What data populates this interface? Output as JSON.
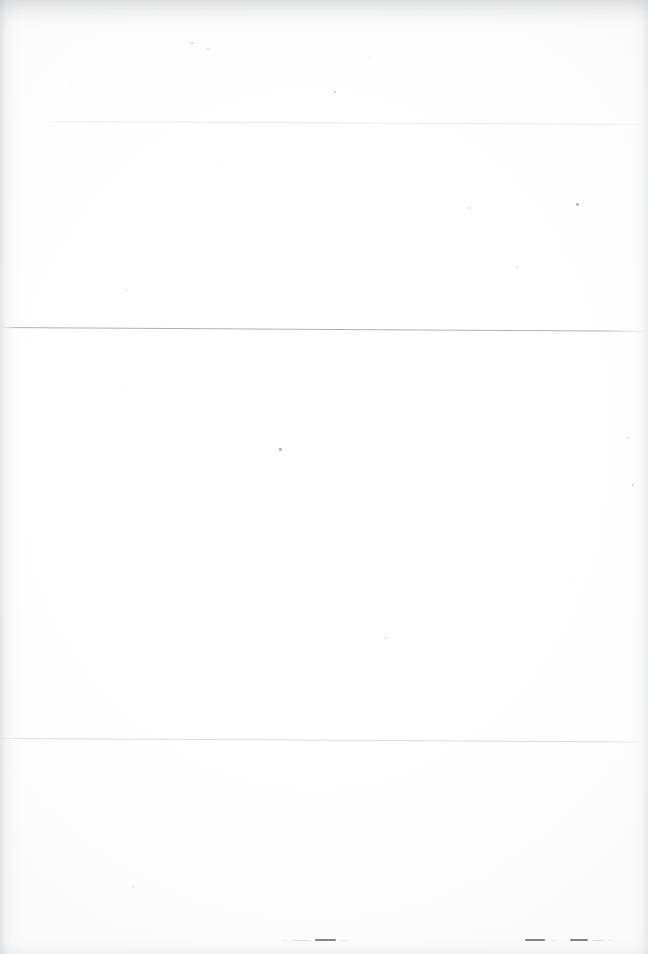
{
  "document": {
    "kind": "scanned-page",
    "appearance": "blank",
    "legible_text": "",
    "note_visible_text_count": 0,
    "page_width_px": 648,
    "page_height_px": 954,
    "paper_color": "#fefefe",
    "ink_color": "#6c6e74"
  },
  "rules": [
    {
      "name": "rule-upper",
      "x_start_px": 47,
      "x_end_px": 648,
      "y_px": 121,
      "thickness_px": 1,
      "skew_deg": 0.28,
      "opacity": 0.3,
      "color": "#b9bbc0"
    },
    {
      "name": "rule-middle",
      "x_start_px": 0,
      "x_end_px": 648,
      "y_px": 327,
      "thickness_px": 1,
      "skew_deg": 0.33,
      "opacity": 0.7,
      "color": "#8d8f95"
    },
    {
      "name": "rule-lower",
      "x_start_px": 0,
      "x_end_px": 648,
      "y_px": 738,
      "thickness_px": 1,
      "skew_deg": 0.3,
      "opacity": 0.42,
      "color": "#aaacb1"
    }
  ],
  "footer_marks": {
    "name": "footer-dashes",
    "y_px": 939,
    "description": "degraded dash fragments, no legible characters",
    "clusters": [
      {
        "name": "footer-dash-cluster-left",
        "x_px": 283,
        "dashes": [
          {
            "width_px": 4,
            "gap_px": 6,
            "weight": "fainter"
          },
          {
            "width_px": 17,
            "gap_px": 5,
            "weight": "faint"
          },
          {
            "width_px": 21,
            "gap_px": 4,
            "weight": "strong"
          },
          {
            "width_px": 8,
            "gap_px": 0,
            "weight": "fainter"
          }
        ]
      },
      {
        "name": "footer-dash-cluster-right-a",
        "x_px": 525,
        "dashes": [
          {
            "width_px": 20,
            "gap_px": 5,
            "weight": "strong"
          },
          {
            "width_px": 6,
            "gap_px": 0,
            "weight": "fainter"
          }
        ]
      },
      {
        "name": "footer-dash-cluster-right-b",
        "x_px": 570,
        "dashes": [
          {
            "width_px": 18,
            "gap_px": 5,
            "weight": "strong"
          },
          {
            "width_px": 10,
            "gap_px": 5,
            "weight": "faint"
          },
          {
            "width_px": 5,
            "gap_px": 0,
            "weight": "fainter"
          }
        ]
      }
    ]
  },
  "artifacts": {
    "name": "scan-artifacts",
    "edge_shadows": [
      "top",
      "left",
      "right",
      "bottom"
    ],
    "specks": [
      {
        "x_px": 191,
        "y_px": 42,
        "size_px": 2,
        "opacity": 0.38
      },
      {
        "x_px": 207,
        "y_px": 48,
        "size_px": 1.5,
        "opacity": 0.26
      },
      {
        "x_px": 334,
        "y_px": 91,
        "size_px": 2,
        "opacity": 0.4
      },
      {
        "x_px": 576,
        "y_px": 203,
        "size_px": 2.5,
        "opacity": 0.48
      },
      {
        "x_px": 468,
        "y_px": 207,
        "size_px": 1.5,
        "opacity": 0.22
      },
      {
        "x_px": 279,
        "y_px": 448,
        "size_px": 2.5,
        "opacity": 0.52
      },
      {
        "x_px": 627,
        "y_px": 437,
        "size_px": 1.5,
        "opacity": 0.24
      },
      {
        "x_px": 632,
        "y_px": 484,
        "size_px": 2,
        "opacity": 0.32
      },
      {
        "x_px": 385,
        "y_px": 637,
        "size_px": 1.5,
        "opacity": 0.22
      },
      {
        "x_px": 125,
        "y_px": 289,
        "size_px": 1.5,
        "opacity": 0.2
      },
      {
        "x_px": 516,
        "y_px": 266,
        "size_px": 1.5,
        "opacity": 0.2
      },
      {
        "x_px": 132,
        "y_px": 886,
        "size_px": 1.5,
        "opacity": 0.2
      }
    ]
  }
}
